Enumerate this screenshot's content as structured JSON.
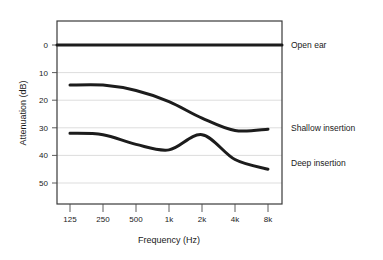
{
  "chart_data": {
    "type": "line",
    "title": "",
    "xlabel": "Frequency (Hz)",
    "ylabel": "Attenuation (dB)",
    "x_tick_labels": [
      "125",
      "250",
      "500",
      "1k",
      "2k",
      "4k",
      "8k"
    ],
    "x_values": [
      125,
      250,
      500,
      1000,
      2000,
      4000,
      8000
    ],
    "y_tick_labels": [
      "0",
      "10",
      "20",
      "30",
      "40",
      "50"
    ],
    "ylim": [
      0,
      55
    ],
    "y_axis_inverted": true,
    "grid": "horizontal",
    "legend_position": "right-inline",
    "series": [
      {
        "name": "Open ear",
        "label": "Open ear",
        "values": [
          0,
          0,
          0,
          0,
          0,
          0,
          0
        ]
      },
      {
        "name": "Shallow insertion",
        "label": "Shallow insertion",
        "values": [
          14.5,
          14.5,
          16.5,
          20.5,
          26.5,
          31,
          30.5
        ]
      },
      {
        "name": "Deep insertion",
        "label": "Deep insertion",
        "values": [
          32,
          32.5,
          36,
          38,
          32.5,
          41.5,
          45
        ]
      }
    ]
  },
  "labels": {
    "open_ear": "Open ear",
    "shallow_insertion": "Shallow insertion",
    "deep_insertion": "Deep insertion",
    "x_axis_title": "Frequency (Hz)",
    "y_axis_title": "Attenuation (dB)",
    "x_tick_125": "125",
    "x_tick_250": "250",
    "x_tick_500": "500",
    "x_tick_1k": "1k",
    "x_tick_2k": "2k",
    "x_tick_4k": "4k",
    "x_tick_8k": "8k",
    "y_tick_0": "0",
    "y_tick_10": "10",
    "y_tick_20": "20",
    "y_tick_30": "30",
    "y_tick_40": "40",
    "y_tick_50": "50"
  },
  "colors": {
    "curve": "#1c1c1c",
    "frame": "#3a3a3a",
    "grid": "#cfcfcf",
    "background": "#ffffff",
    "text": "#1a1a1a"
  }
}
